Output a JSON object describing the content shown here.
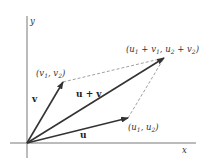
{
  "diagram": {
    "axes": {
      "x_label": "x",
      "y_label": "y"
    },
    "vectors": [
      {
        "name": "u",
        "label": "u",
        "tip_label": "(u1, u2)"
      },
      {
        "name": "v",
        "label": "v",
        "tip_label": "(v1, v2)"
      },
      {
        "name": "u+v",
        "label": "u + v",
        "tip_label": "(u1 + v1, u2 + v2)"
      }
    ],
    "colors": {
      "vector": "#333333",
      "axis": "#555555",
      "dashed": "#777777"
    }
  }
}
